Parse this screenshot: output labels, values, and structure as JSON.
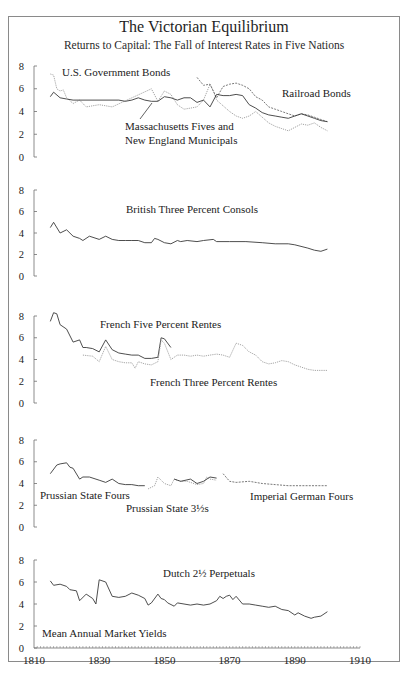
{
  "header": {
    "title": "The Victorian Equilibrium",
    "subtitle": "Returns to Capital: The Fall of  Interest Rates in Five Nations"
  },
  "colors": {
    "frame": "#8a8a8a",
    "axis": "#6e6e6e",
    "solid_series": "#3a3a3a",
    "dotted_series": "#6a6a6a",
    "light_series": "#9a9a9a",
    "text": "#222222"
  },
  "chart_data": {
    "type": "line",
    "title": "The Victorian Equilibrium",
    "subtitle": "Returns to Capital: The Fall of  Interest Rates in Five Nations",
    "xlabel": "",
    "ylabel": "Mean Annual Market Yields",
    "xlim": [
      1810,
      1910
    ],
    "x_ticks": [
      1810,
      1830,
      1850,
      1870,
      1890,
      1910
    ],
    "ylim": [
      0,
      8
    ],
    "y_ticks": [
      0,
      2,
      4,
      6,
      8
    ],
    "grid": false,
    "panels": [
      {
        "name": "United States",
        "labels": [
          "U.S. Government Bonds",
          "Railroad Bonds",
          "Massachusetts Fives and",
          "New England Municipals"
        ],
        "series": [
          {
            "name": "U.S. Government Bonds",
            "style": "dotted",
            "x": [
              1815,
              1816,
              1817,
              1818,
              1819,
              1820,
              1822,
              1824,
              1826,
              1828,
              1830,
              1832,
              1834,
              1846,
              1848,
              1850,
              1852,
              1854,
              1856,
              1858,
              1860,
              1862,
              1864,
              1865,
              1866,
              1868,
              1870,
              1872,
              1874,
              1876,
              1878,
              1880,
              1882,
              1884,
              1886,
              1888,
              1890,
              1892,
              1894,
              1896,
              1898,
              1900
            ],
            "values": [
              7.3,
              7.2,
              6.0,
              5.8,
              5.9,
              5.2,
              4.7,
              5.0,
              4.4,
              4.5,
              4.6,
              4.5,
              4.4,
              6.0,
              4.9,
              5.8,
              5.5,
              4.6,
              4.2,
              4.3,
              4.4,
              5.0,
              6.4,
              5.8,
              5.0,
              4.5,
              4.0,
              3.6,
              3.4,
              3.6,
              4.0,
              3.5,
              3.0,
              2.7,
              2.5,
              2.3,
              2.6,
              2.9,
              2.8,
              3.0,
              2.6,
              2.3
            ]
          },
          {
            "name": "Railroad Bonds",
            "style": "dashed",
            "x": [
              1860,
              1862,
              1864,
              1866,
              1868,
              1870,
              1872,
              1874,
              1876,
              1878,
              1880,
              1882,
              1884,
              1886,
              1888,
              1890,
              1892,
              1894,
              1896,
              1898,
              1900
            ],
            "values": [
              7.0,
              6.3,
              6.4,
              5.2,
              6.2,
              6.4,
              6.5,
              6.3,
              6.0,
              5.3,
              5.0,
              4.4,
              4.2,
              4.0,
              3.8,
              3.6,
              3.8,
              3.7,
              3.5,
              3.3,
              3.1
            ]
          },
          {
            "name": "Massachusetts Fives and New England Municipals",
            "style": "solid",
            "x": [
              1815,
              1816,
              1818,
              1820,
              1822,
              1836,
              1838,
              1840,
              1842,
              1844,
              1846,
              1848,
              1850,
              1852,
              1854,
              1856,
              1858,
              1860,
              1862,
              1864,
              1866,
              1868,
              1870,
              1872,
              1874,
              1876,
              1878,
              1880,
              1882,
              1884,
              1886,
              1888,
              1890,
              1892,
              1894,
              1896,
              1898,
              1900
            ],
            "values": [
              5.3,
              5.7,
              5.2,
              5.1,
              5.0,
              5.0,
              4.9,
              5.0,
              5.2,
              5.0,
              4.9,
              4.9,
              5.3,
              5.2,
              5.0,
              5.2,
              5.2,
              4.8,
              5.0,
              4.4,
              5.5,
              5.4,
              5.4,
              5.5,
              5.4,
              4.6,
              4.3,
              3.9,
              3.7,
              3.6,
              3.5,
              3.4,
              3.6,
              3.8,
              3.6,
              3.4,
              3.2,
              3.1
            ]
          }
        ]
      },
      {
        "name": "Britain",
        "labels": [
          "British Three Percent Consols"
        ],
        "series": [
          {
            "name": "British Three Percent Consols",
            "style": "solid",
            "x": [
              1815,
              1816,
              1818,
              1820,
              1822,
              1824,
              1825,
              1827,
              1830,
              1832,
              1834,
              1836,
              1838,
              1840,
              1842,
              1844,
              1846,
              1847,
              1848,
              1850,
              1852,
              1854,
              1855,
              1857,
              1860,
              1862,
              1865,
              1866,
              1870,
              1875,
              1880,
              1884,
              1888,
              1890,
              1894,
              1896,
              1898,
              1900
            ],
            "values": [
              4.5,
              5.0,
              4.0,
              4.3,
              3.7,
              3.5,
              3.3,
              3.7,
              3.4,
              3.7,
              3.4,
              3.3,
              3.3,
              3.3,
              3.3,
              3.1,
              3.1,
              3.5,
              3.4,
              3.1,
              3.0,
              3.3,
              3.2,
              3.3,
              3.2,
              3.3,
              3.4,
              3.2,
              3.2,
              3.2,
              3.1,
              3.0,
              3.0,
              2.9,
              2.6,
              2.4,
              2.3,
              2.5
            ]
          }
        ]
      },
      {
        "name": "France",
        "labels": [
          "French Five Percent Rentes",
          "French Three Percent Rentes"
        ],
        "series": [
          {
            "name": "French Five Percent Rentes",
            "style": "solid",
            "x": [
              1815,
              1816,
              1817,
              1818,
              1820,
              1822,
              1824,
              1825,
              1826,
              1828,
              1830,
              1832,
              1834,
              1836,
              1838,
              1840,
              1842,
              1844,
              1846,
              1848,
              1849,
              1850,
              1852
            ],
            "values": [
              7.5,
              8.3,
              8.2,
              7.2,
              6.8,
              5.6,
              5.8,
              5.1,
              5.1,
              5.0,
              4.7,
              5.8,
              4.9,
              4.6,
              4.5,
              4.4,
              4.4,
              4.1,
              4.1,
              4.2,
              6.0,
              5.9,
              5.1
            ]
          },
          {
            "name": "French Three Percent Rentes",
            "style": "dotted",
            "x": [
              1825,
              1828,
              1830,
              1832,
              1834,
              1836,
              1838,
              1840,
              1841,
              1842,
              1844,
              1846,
              1848,
              1849,
              1850,
              1852,
              1854,
              1856,
              1858,
              1860,
              1862,
              1864,
              1866,
              1868,
              1870,
              1872,
              1874,
              1876,
              1878,
              1880,
              1882,
              1884,
              1886,
              1888,
              1890,
              1892,
              1894,
              1896,
              1898,
              1900
            ],
            "values": [
              4.4,
              4.3,
              3.8,
              5.2,
              4.0,
              3.8,
              3.7,
              3.7,
              3.2,
              3.8,
              3.6,
              3.5,
              3.8,
              5.8,
              5.5,
              4.0,
              4.4,
              4.4,
              4.3,
              4.4,
              4.3,
              4.4,
              4.5,
              4.4,
              4.2,
              5.5,
              5.3,
              4.7,
              4.4,
              3.8,
              3.6,
              3.7,
              3.9,
              3.8,
              3.5,
              3.3,
              3.1,
              3.0,
              3.0,
              3.0
            ]
          }
        ]
      },
      {
        "name": "Prussia / Germany",
        "labels": [
          "Prussian State Fours",
          "Prussian State 3½s",
          "Imperial German Fours"
        ],
        "series": [
          {
            "name": "Prussian State Fours",
            "style": "solid",
            "x": [
              1815,
              1817,
              1818,
              1820,
              1821,
              1822,
              1824,
              1825,
              1827,
              1830,
              1832,
              1834,
              1836,
              1838,
              1840,
              1842,
              1844
            ],
            "values": [
              4.9,
              5.7,
              5.8,
              5.9,
              5.5,
              5.4,
              4.4,
              4.6,
              4.6,
              4.3,
              4.1,
              4.4,
              4.0,
              3.9,
              3.9,
              3.8,
              3.8
            ]
          },
          {
            "name": "Prussian State 3½s",
            "style": "dotted",
            "x": [
              1845,
              1847,
              1848,
              1850,
              1852,
              1853,
              1855,
              1857,
              1860,
              1862,
              1863,
              1864,
              1866
            ],
            "values": [
              3.5,
              3.8,
              4.6,
              4.0,
              3.8,
              4.4,
              4.2,
              4.2,
              3.9,
              4.0,
              4.6,
              4.4,
              4.3
            ]
          },
          {
            "name": "Prussian State Fours (later)",
            "style": "solid",
            "x": [
              1853,
              1855,
              1858,
              1860,
              1862,
              1864,
              1866
            ],
            "values": [
              4.4,
              4.2,
              4.4,
              4.0,
              4.2,
              4.6,
              4.5
            ]
          },
          {
            "name": "Imperial German Fours",
            "style": "dashed",
            "x": [
              1868,
              1870,
              1872,
              1876,
              1880,
              1884,
              1888,
              1892,
              1896,
              1900
            ],
            "values": [
              4.9,
              4.2,
              4.1,
              4.2,
              4.0,
              3.9,
              3.8,
              3.8,
              3.8,
              3.8
            ]
          }
        ]
      },
      {
        "name": "Netherlands",
        "labels": [
          "Dutch 2½ Perpetuals",
          "Mean Annual Market Yields"
        ],
        "series": [
          {
            "name": "Dutch 2½ Perpetuals",
            "style": "solid",
            "x": [
              1815,
              1816,
              1818,
              1820,
              1821,
              1823,
              1824,
              1826,
              1828,
              1829,
              1830,
              1832,
              1834,
              1836,
              1838,
              1840,
              1842,
              1844,
              1845,
              1846,
              1848,
              1849,
              1850,
              1851,
              1853,
              1854,
              1856,
              1858,
              1860,
              1862,
              1864,
              1866,
              1867,
              1868,
              1869,
              1870,
              1871,
              1872,
              1874,
              1876,
              1878,
              1880,
              1882,
              1884,
              1886,
              1888,
              1890,
              1891,
              1893,
              1895,
              1896,
              1898,
              1900
            ],
            "values": [
              6.1,
              5.7,
              5.8,
              5.6,
              5.3,
              5.2,
              4.3,
              4.9,
              4.5,
              4.0,
              6.2,
              6.0,
              4.7,
              4.6,
              4.7,
              5.0,
              4.8,
              4.5,
              3.9,
              4.1,
              4.9,
              4.5,
              4.4,
              4.1,
              3.8,
              4.1,
              4.0,
              3.9,
              4.0,
              3.9,
              4.0,
              4.3,
              4.7,
              4.5,
              4.7,
              4.8,
              4.4,
              4.7,
              4.0,
              4.0,
              3.9,
              3.8,
              3.7,
              3.8,
              3.5,
              3.4,
              3.0,
              3.2,
              2.9,
              2.7,
              2.8,
              2.9,
              3.3
            ]
          }
        ]
      }
    ]
  },
  "axes": {
    "x_tick_labels": [
      "1810",
      "1830",
      "1850",
      "1870",
      "1890",
      "1910"
    ],
    "y_tick_labels": [
      "0",
      "2",
      "4",
      "6",
      "8"
    ]
  },
  "annotations": {
    "us_gov": "U.S. Government Bonds",
    "railroad": "Railroad Bonds",
    "mass_1": "Massachusetts Fives and",
    "mass_2": "New England Municipals",
    "british": "British Three Percent Consols",
    "french5": "French Five Percent Rentes",
    "french3": "French Three Percent Rentes",
    "prussian4": "Prussian State Fours",
    "prussian35": "Prussian State 3½s",
    "german4": "Imperial German Fours",
    "dutch": "Dutch 2½ Perpetuals",
    "yield_label": "Mean Annual Market Yields"
  }
}
